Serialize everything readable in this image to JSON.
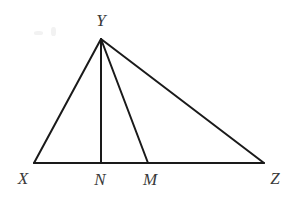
{
  "figure": {
    "background_color": "#ffffff",
    "stroke_color": "#1a1a1a",
    "label_color": "#3a3a3a",
    "stroke_width": 2,
    "width": 300,
    "height": 205
  },
  "points": {
    "X": {
      "label": "X",
      "x": 34,
      "y": 163,
      "label_x": 23,
      "label_y": 178
    },
    "Y": {
      "label": "Y",
      "x": 101,
      "y": 39,
      "label_x": 101,
      "label_y": 20
    },
    "N": {
      "label": "N",
      "x": 101,
      "y": 163,
      "label_x": 100,
      "label_y": 179
    },
    "M": {
      "label": "M",
      "x": 148,
      "y": 163,
      "label_x": 150,
      "label_y": 179
    },
    "Z": {
      "label": "Z",
      "x": 264,
      "y": 163,
      "label_x": 275,
      "label_y": 178
    }
  },
  "segments": [
    {
      "name": "segment-XZ",
      "x1": 34,
      "y1": 163,
      "x2": 264,
      "y2": 163
    },
    {
      "name": "segment-XY",
      "x1": 34,
      "y1": 163,
      "x2": 101,
      "y2": 39
    },
    {
      "name": "segment-YZ",
      "x1": 101,
      "y1": 39,
      "x2": 264,
      "y2": 163
    },
    {
      "name": "segment-YN",
      "x1": 101,
      "y1": 39,
      "x2": 101,
      "y2": 163
    },
    {
      "name": "segment-YM",
      "x1": 101,
      "y1": 39,
      "x2": 148,
      "y2": 163
    }
  ],
  "chart_data": {
    "type": "diagram",
    "vertices": [
      {
        "id": "X",
        "x": 34,
        "y": 163
      },
      {
        "id": "Y",
        "x": 101,
        "y": 39
      },
      {
        "id": "Z",
        "x": 264,
        "y": 163
      }
    ],
    "base_points": [
      {
        "id": "X",
        "x": 34,
        "y": 163
      },
      {
        "id": "N",
        "x": 101,
        "y": 163
      },
      {
        "id": "M",
        "x": 148,
        "y": 163
      },
      {
        "id": "Z",
        "x": 264,
        "y": 163
      }
    ],
    "edges": [
      "XZ",
      "XY",
      "YZ",
      "YN",
      "YM"
    ]
  }
}
